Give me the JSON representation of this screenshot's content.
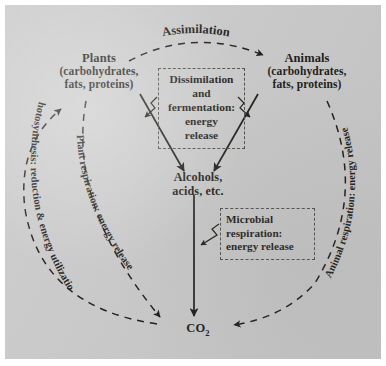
{
  "figure": {
    "kind": "carbon-cycle-diagram",
    "background_color": "#c9c9c9",
    "ink_color": "#15130f",
    "border_color": "#ffffff"
  },
  "nodes": {
    "plants": {
      "title": "Plants",
      "sub_line1": "(carbohydrates,",
      "sub_line2": "fats, proteins)"
    },
    "animals": {
      "title": "Animals",
      "sub_line1": "(carbohydrates,",
      "sub_line2": "fats, proteins)"
    },
    "alcohols": {
      "line1": "Alcohols,",
      "line2": "acids, etc."
    },
    "co2": {
      "formula": "CO",
      "subscript": "2"
    }
  },
  "callouts": {
    "dissimilation": {
      "line1": "Dissimilation",
      "line2": "and",
      "line3": "fermentation:",
      "line4": "energy",
      "line5": "release"
    },
    "microbial": {
      "line1": "Microbial",
      "line2": "respiration:",
      "line3": "energy release"
    }
  },
  "arc_labels": {
    "assimilation": "Assimilation",
    "photosynthesis": "Photosynthesis: reduction & energy utilization",
    "plant_respiration": "Plant respiration: energy release",
    "animal_respiration": "Animal respiration: energy release"
  }
}
